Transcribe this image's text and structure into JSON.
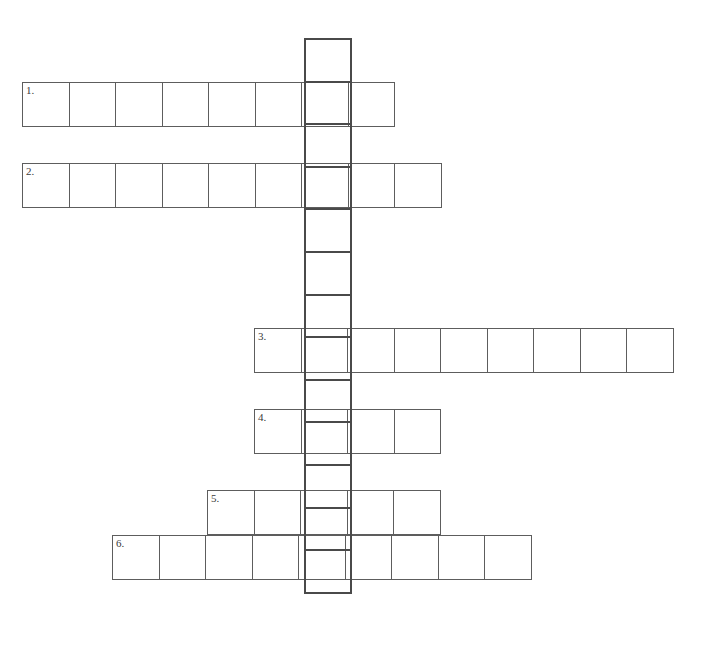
{
  "puzzle": {
    "type": "crossword",
    "title": "",
    "canvas": {
      "width": 718,
      "height": 650
    },
    "background_color": "#ffffff",
    "cell_border_color": "#5d5d5d",
    "down_border_color": "#4a4a4a",
    "cell_width": 47.5,
    "cell_height": 44.6,
    "down_column": {
      "label": "",
      "x": 304,
      "y": 38,
      "cell_count": 13,
      "highlighted": true
    },
    "across_entries": [
      {
        "number": "1.",
        "x": 22,
        "y": 82,
        "cell_count": 8,
        "intersect_index": 6
      },
      {
        "number": "2.",
        "x": 22,
        "y": 163,
        "cell_count": 9,
        "intersect_index": 6
      },
      {
        "number": "3.",
        "x": 254,
        "y": 328,
        "cell_count": 9,
        "intersect_index": 1
      },
      {
        "number": "4.",
        "x": 254,
        "y": 409,
        "cell_count": 4,
        "intersect_index": 1
      },
      {
        "number": "5.",
        "x": 207,
        "y": 490,
        "cell_count": 5,
        "intersect_index": 2
      },
      {
        "number": "6.",
        "x": 112,
        "y": 535,
        "cell_count": 9,
        "intersect_index": 4
      }
    ]
  }
}
